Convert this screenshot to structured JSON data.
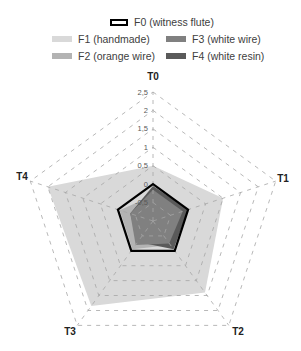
{
  "chart_data": {
    "type": "radar",
    "title": "",
    "categories": [
      "T0",
      "T1",
      "T2",
      "T3",
      "T4"
    ],
    "rlim": [
      -1,
      2.5
    ],
    "ticks": [
      -1,
      -0.5,
      0,
      0.5,
      1,
      1.5,
      2,
      2.5
    ],
    "tick_labels": [
      "-1",
      "-0,5",
      "0",
      "0,5",
      "1",
      "1,5",
      "2",
      "2,5"
    ],
    "grid": "dashed",
    "legend_position": "top",
    "series": [
      {
        "name": "F1 (handmade)",
        "values": [
          0.5,
          1.0,
          1.4,
          1.85,
          2.0
        ],
        "color": "#d9d9d9",
        "style": "filled"
      },
      {
        "name": "F2 (orange wire)",
        "values": [
          -0.3,
          -0.2,
          -0.2,
          -0.05,
          -0.05
        ],
        "color": "#b3b3b3",
        "style": "filled"
      },
      {
        "name": "F4 (white resin)",
        "values": [
          -0.05,
          0.0,
          -0.05,
          -0.3,
          -0.35
        ],
        "color": "#5a5a5a",
        "style": "filled"
      },
      {
        "name": "F3 (white wire)",
        "values": [
          -0.15,
          -0.15,
          -0.25,
          -0.2,
          -0.35
        ],
        "color": "#808080",
        "style": "filled"
      },
      {
        "name": "F0 (witness flute)",
        "values": [
          0,
          0,
          0,
          0,
          0
        ],
        "color": "#000000",
        "style": "outline"
      }
    ]
  },
  "legend": {
    "f0": "F0 (witness flute)",
    "f1": "F1 (handmade)",
    "f2": "F2 (orange wire)",
    "f3": "F3 (white wire)",
    "f4": "F4 (white resin)"
  },
  "colors": {
    "f1": "#d9d9d9",
    "f2": "#b3b3b3",
    "f3": "#808080",
    "f4": "#5a5a5a",
    "f0_outline": "#000000",
    "grid": "#a6a6a6"
  }
}
